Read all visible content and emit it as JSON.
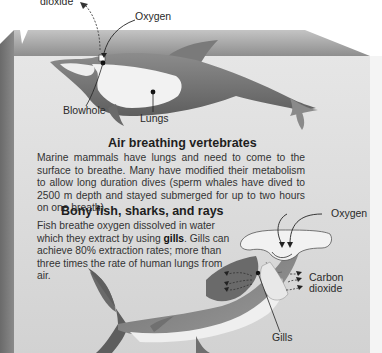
{
  "labels": {
    "co2_top": "dioxide",
    "oxygen_top": "Oxygen",
    "blowhole": "Blowhole",
    "lungs": "Lungs",
    "oxygen_shark": "Oxygen",
    "co2_shark_line1": "Carbon",
    "co2_shark_line2": "dioxide",
    "gills": "Gills"
  },
  "sections": {
    "air": {
      "heading": "Air breathing vertebrates",
      "text": "Marine mammals have lungs and need to come to the surface to breathe. Many have modified their metabolism to allow long duration dives (sperm whales have dived to 2500 m depth and stayed submerged for up to two hours on one breath)."
    },
    "fish": {
      "heading": "Bony fish, sharks, and rays",
      "text_before": "Fish breathe oxygen dissolved in water which they extract by using ",
      "bold": "gills",
      "text_after": ". Gills can achieve 80% extraction rates; more than three times the rate of human lungs from air."
    }
  },
  "colors": {
    "water_face": "#d9d9d9",
    "surface_top": "#9a9a9a",
    "left_face": "#7d7d7d",
    "animal_dark": "#707070",
    "animal_light": "#f2f2f2"
  }
}
